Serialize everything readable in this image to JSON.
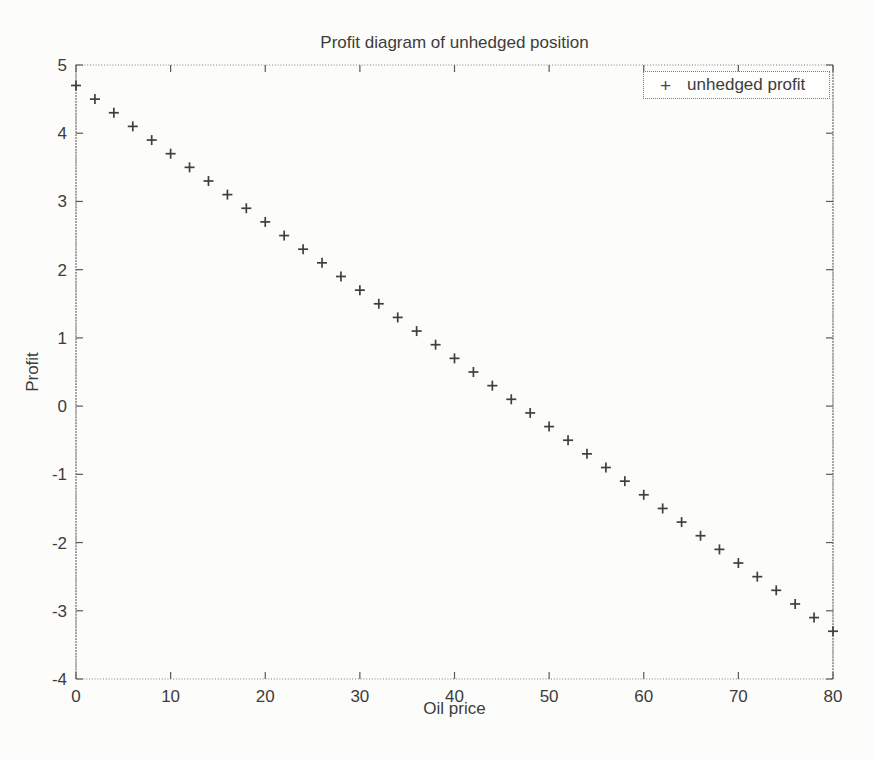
{
  "figure": {
    "background": "#fcfcfa",
    "ink": "#3c3c3c",
    "axis_color": "#808080",
    "tick_color": "#5a5a5a"
  },
  "chart_data": {
    "type": "scatter",
    "title": "Profit diagram of unhedged position",
    "xlabel": "Oil price",
    "ylabel": "Profit",
    "xlim": [
      0,
      80
    ],
    "ylim": [
      -4,
      5
    ],
    "xticks": [
      0,
      10,
      20,
      30,
      40,
      50,
      60,
      70,
      80
    ],
    "yticks": [
      -4,
      -3,
      -2,
      -1,
      0,
      1,
      2,
      3,
      4,
      5
    ],
    "grid": false,
    "marker": "+",
    "marker_color": "#3f3f3f",
    "legend": {
      "position": "top-right",
      "entries": [
        {
          "marker": "+",
          "label": "unhedged profit"
        }
      ]
    },
    "series": [
      {
        "name": "unhedged profit",
        "x": [
          0,
          2,
          4,
          6,
          8,
          10,
          12,
          14,
          16,
          18,
          20,
          22,
          24,
          26,
          28,
          30,
          32,
          34,
          36,
          38,
          40,
          42,
          44,
          46,
          48,
          50,
          52,
          54,
          56,
          58,
          60,
          62,
          64,
          66,
          68,
          70,
          72,
          74,
          76,
          78,
          80
        ],
        "y": [
          4.7,
          4.5,
          4.3,
          4.1,
          3.9,
          3.7,
          3.5,
          3.3,
          3.1,
          2.9,
          2.7,
          2.5,
          2.3,
          2.1,
          1.9,
          1.7,
          1.5,
          1.3,
          1.1,
          0.9,
          0.7,
          0.5,
          0.3,
          0.1,
          -0.1,
          -0.3,
          -0.5,
          -0.7,
          -0.9,
          -1.1,
          -1.3,
          -1.5,
          -1.7,
          -1.9,
          -2.1,
          -2.3,
          -2.5,
          -2.7,
          -2.9,
          -3.1,
          -3.3
        ]
      }
    ]
  }
}
